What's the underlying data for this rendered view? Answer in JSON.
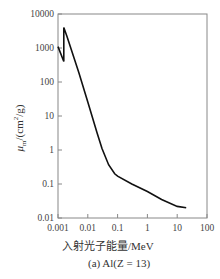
{
  "chart_data": {
    "type": "line",
    "title": "",
    "caption": "(a) Al(Z = 13)",
    "xlabel": "入射光子能量/MeV",
    "ylabel": "μm/(cm²/g)",
    "xscale": "log",
    "yscale": "log",
    "xlim": [
      0.001,
      100
    ],
    "ylim": [
      0.01,
      10000
    ],
    "xticks": [
      "0.001",
      "0.01",
      "0.1",
      "1",
      "10",
      "100"
    ],
    "yticks": [
      "0.01",
      "0.1",
      "1",
      "10",
      "100",
      "1000",
      "10000"
    ],
    "grid": false,
    "series": [
      {
        "name": "Al",
        "x": [
          0.001,
          0.00156,
          0.00156,
          0.002,
          0.005,
          0.01,
          0.02,
          0.03,
          0.05,
          0.08,
          0.1,
          0.3,
          1,
          3,
          10,
          20
        ],
        "y": [
          1100,
          400,
          4000,
          2200,
          190,
          26,
          3.4,
          1.1,
          0.37,
          0.2,
          0.17,
          0.1,
          0.06,
          0.035,
          0.022,
          0.02
        ]
      }
    ]
  }
}
